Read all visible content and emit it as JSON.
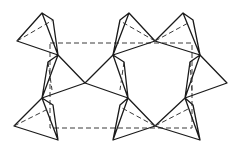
{
  "figure": {
    "type": "crystal-structure-diagram",
    "colors": {
      "line": "#1a1a1a",
      "dashed": "#3a3a3a",
      "background": "#ffffff"
    },
    "unit_cell": {
      "x1": 50,
      "y1": 43,
      "x2": 192,
      "y2": 128
    },
    "tetrahedra": [
      {
        "id": "tl",
        "solid": [
          [
            42,
            13
          ],
          [
            53,
            20
          ],
          [
            58,
            55
          ],
          [
            42,
            13
          ],
          [
            17,
            41
          ],
          [
            58,
            55
          ]
        ],
        "dashed": [
          [
            17,
            41
          ],
          [
            53,
            20
          ]
        ]
      },
      {
        "id": "ml",
        "solid": [
          [
            58,
            55
          ],
          [
            48,
            62
          ],
          [
            42,
            98
          ],
          [
            85,
            83
          ],
          [
            58,
            55
          ],
          [
            42,
            98
          ]
        ],
        "dashed": [
          [
            48,
            62
          ],
          [
            52,
            90
          ]
        ]
      },
      {
        "id": "bl",
        "solid": [
          [
            42,
            98
          ],
          [
            53,
            105
          ],
          [
            58,
            140
          ],
          [
            42,
            98
          ],
          [
            14,
            126
          ],
          [
            58,
            140
          ]
        ],
        "dashed": [
          [
            14,
            126
          ],
          [
            50,
            108
          ]
        ]
      },
      {
        "id": "tm",
        "solid": [
          [
            129,
            13
          ],
          [
            120,
            20
          ],
          [
            113,
            55
          ],
          [
            129,
            13
          ],
          [
            155,
            41
          ],
          [
            113,
            55
          ]
        ],
        "dashed": [
          [
            155,
            41
          ],
          [
            122,
            22
          ]
        ]
      },
      {
        "id": "mm",
        "solid": [
          [
            113,
            55
          ],
          [
            124,
            62
          ],
          [
            128,
            98
          ],
          [
            85,
            83
          ],
          [
            113,
            55
          ],
          [
            128,
            98
          ]
        ],
        "dashed": [
          [
            124,
            62
          ],
          [
            120,
            90
          ]
        ]
      },
      {
        "id": "bm",
        "solid": [
          [
            128,
            98
          ],
          [
            120,
            105
          ],
          [
            113,
            140
          ],
          [
            128,
            98
          ],
          [
            155,
            126
          ],
          [
            113,
            140
          ]
        ],
        "dashed": [
          [
            155,
            126
          ],
          [
            122,
            108
          ]
        ]
      },
      {
        "id": "tr",
        "solid": [
          [
            183,
            13
          ],
          [
            193,
            20
          ],
          [
            200,
            55
          ],
          [
            183,
            13
          ],
          [
            155,
            41
          ],
          [
            200,
            55
          ]
        ],
        "dashed": [
          [
            155,
            41
          ],
          [
            190,
            22
          ]
        ]
      },
      {
        "id": "mr",
        "solid": [
          [
            200,
            55
          ],
          [
            190,
            62
          ],
          [
            185,
            98
          ],
          [
            227,
            83
          ],
          [
            200,
            55
          ],
          [
            185,
            98
          ]
        ],
        "dashed": [
          [
            190,
            62
          ],
          [
            192,
            92
          ]
        ]
      },
      {
        "id": "br",
        "solid": [
          [
            185,
            98
          ],
          [
            193,
            105
          ],
          [
            200,
            140
          ],
          [
            185,
            98
          ],
          [
            155,
            126
          ],
          [
            200,
            140
          ]
        ],
        "dashed": [
          [
            155,
            126
          ],
          [
            190,
            108
          ]
        ]
      }
    ]
  }
}
